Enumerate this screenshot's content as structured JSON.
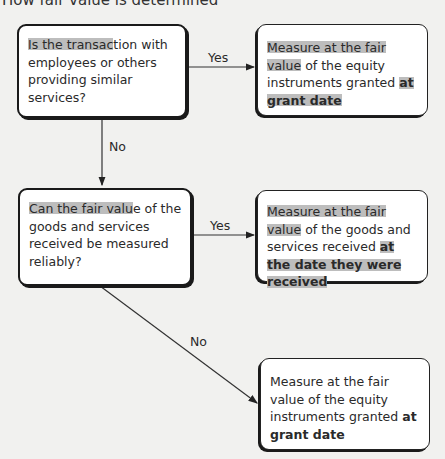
{
  "title": "How fair value is determined",
  "nodes": {
    "q1": {
      "type": "decision",
      "text_highlight": "Is the transac",
      "text_rest": "tion with employees or others providing similar services?"
    },
    "a1": {
      "type": "outcome",
      "text_highlight": "Measure at the fair value",
      "text_mid": " of the equity instruments granted ",
      "text_bold": "at grant date"
    },
    "q2": {
      "type": "decision",
      "text_highlight": "Can the fair valu",
      "text_rest": "e of the goods and services received be measured reliably?"
    },
    "a2": {
      "type": "outcome",
      "text_highlight": "Measure at the fair value",
      "text_mid": " of the goods and services received ",
      "text_bold": "at the date they were received"
    },
    "a3": {
      "type": "outcome",
      "text_plain": "Measure at the fair value of the equity instruments granted ",
      "text_bold": "at grant date"
    }
  },
  "edges": [
    {
      "from": "q1",
      "to": "a1",
      "label": "Yes"
    },
    {
      "from": "q1",
      "to": "q2",
      "label": "No"
    },
    {
      "from": "q2",
      "to": "a2",
      "label": "Yes"
    },
    {
      "from": "q2",
      "to": "a3",
      "label": "No"
    }
  ],
  "colors": {
    "background": "#f1f1ef",
    "box_fill": "#ffffff",
    "border": "#1a1a1a",
    "highlight": "#bdbdbd"
  }
}
